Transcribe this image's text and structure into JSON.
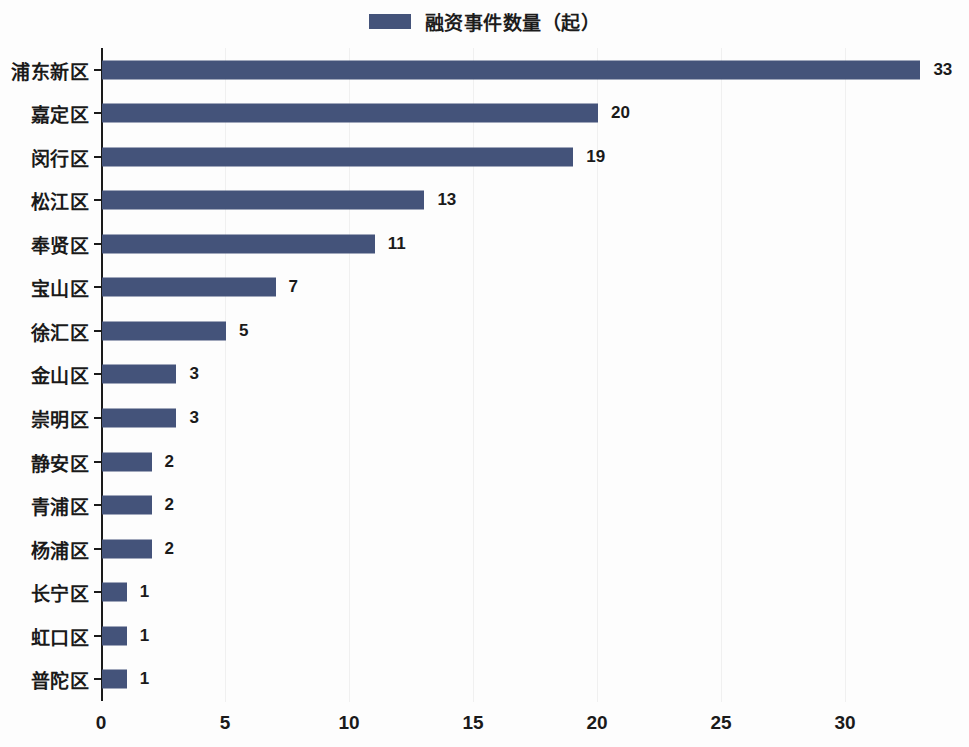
{
  "legend": {
    "label": "融资事件数量（起）",
    "swatch_color": "#44537a"
  },
  "chart_data": {
    "type": "bar",
    "orientation": "horizontal",
    "title": "",
    "subtitle": "",
    "xlabel": "",
    "ylabel": "",
    "categories": [
      "浦东新区",
      "嘉定区",
      "闵行区",
      "松江区",
      "奉贤区",
      "宝山区",
      "徐汇区",
      "金山区",
      "崇明区",
      "静安区",
      "青浦区",
      "杨浦区",
      "长宁区",
      "虹口区",
      "普陀区"
    ],
    "values": [
      33,
      20,
      19,
      13,
      11,
      7,
      5,
      3,
      3,
      2,
      2,
      2,
      1,
      1,
      1
    ],
    "series": [
      {
        "name": "融资事件数量（起）",
        "color": "#44537a",
        "values": [
          33,
          20,
          19,
          13,
          11,
          7,
          5,
          3,
          3,
          2,
          2,
          2,
          1,
          1,
          1
        ]
      }
    ],
    "value_labels": [
      "33",
      "20",
      "19",
      "13",
      "11",
      "7",
      "5",
      "3",
      "3",
      "2",
      "2",
      "2",
      "1",
      "1",
      "1"
    ],
    "xticks": [
      0,
      5,
      10,
      15,
      20,
      25,
      30
    ],
    "xtick_labels": [
      "0",
      "5",
      "10",
      "15",
      "20",
      "25",
      "30"
    ],
    "xlim": [
      0,
      35
    ],
    "grid": "vertical",
    "legend_position": "top-center",
    "background_color": "#fdfdfd",
    "axis_color": "#1a1a1a",
    "gridline_color": "#f0f0f0",
    "text_color": "#1a1a1a"
  }
}
